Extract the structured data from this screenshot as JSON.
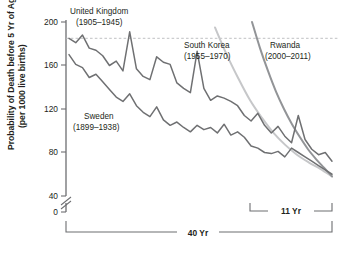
{
  "chart_data": {
    "type": "line",
    "title": "",
    "subtitle": "",
    "xlabel": "",
    "ylabel": "Probability of Death before 5 Yr of Age",
    "ylabel_line2": "(per 1000 live births)",
    "ylim": [
      0,
      200
    ],
    "yticks": [
      0,
      40,
      80,
      120,
      160,
      200
    ],
    "ytick_labels": [
      "0",
      "40",
      "80",
      "120",
      "160",
      "200"
    ],
    "y_axis_break": true,
    "y_axis_break_between": [
      0,
      40
    ],
    "grid": false,
    "legend_position": "inline-annotations",
    "reference_lines": [
      {
        "name": "start-level-dashed",
        "orientation": "horizontal",
        "y": 185,
        "style": "dashed"
      }
    ],
    "annotations": [
      {
        "name": "span-40-yr",
        "label": "40 Yr",
        "x_start": 0,
        "x_end": 100,
        "units": "percent-of-axis"
      },
      {
        "name": "span-11-yr",
        "label": "11 Yr",
        "x_start": 69,
        "x_end": 100,
        "units": "percent-of-axis"
      }
    ],
    "series": [
      {
        "name": "United Kingdom",
        "period": "(1905–1945)",
        "color": "#6f7072",
        "label_x": 70,
        "label_y": 10,
        "x": [
          0,
          1.2,
          2.4,
          3.6,
          4.8,
          6.0,
          7.2,
          8.4,
          9.6,
          10.8,
          12.0,
          13.2,
          14.4,
          15.6,
          16.8,
          18.0,
          19.2,
          20.4,
          21.6,
          22.8,
          24.0,
          25.2,
          26.4,
          27.6,
          28.8,
          30.0,
          31.2,
          32.4,
          33.6,
          34.8,
          36.0,
          37.2,
          38.4,
          39.6,
          40.8,
          42.0,
          43.2,
          44.4,
          45.6,
          46.8
        ],
        "y": [
          185,
          181,
          188,
          176,
          174,
          169,
          160,
          164,
          155,
          191,
          157,
          150,
          147,
          168,
          163,
          161,
          144,
          139,
          135,
          173,
          139,
          128,
          132,
          130,
          127,
          123,
          114,
          109,
          116,
          105,
          98,
          104,
          95,
          89,
          114,
          92,
          83,
          78,
          80,
          72
        ]
      },
      {
        "name": "Sweden",
        "period": "(1899–1938)",
        "color": "#6f7072",
        "label_x": 66,
        "label_y": 116,
        "x": [
          0,
          1.2,
          2.4,
          3.6,
          4.8,
          6.0,
          7.2,
          8.4,
          9.6,
          10.8,
          12.0,
          13.2,
          14.4,
          15.6,
          16.8,
          18.0,
          19.2,
          20.4,
          21.6,
          22.8,
          24.0,
          25.2,
          26.4,
          27.6,
          28.8,
          30.0,
          31.2,
          32.4,
          33.6,
          34.8,
          36.0,
          37.2,
          38.4,
          39.6,
          40.8,
          42.0,
          43.2,
          44.4,
          45.6,
          46.8
        ],
        "y": [
          170,
          161,
          158,
          149,
          152,
          145,
          138,
          131,
          127,
          134,
          123,
          117,
          113,
          122,
          110,
          105,
          108,
          103,
          99,
          105,
          101,
          103,
          98,
          106,
          96,
          99,
          94,
          86,
          84,
          80,
          79,
          81,
          76,
          84,
          80,
          76,
          72,
          68,
          64,
          60
        ]
      },
      {
        "name": "South Korea",
        "period": "(1955–1970)",
        "color": "#c6c7c9",
        "label_x": 187,
        "label_y": 45,
        "x": [
          0,
          10,
          20,
          30,
          40,
          50,
          60,
          70,
          80,
          90,
          100
        ],
        "y": [
          195,
          170,
          148,
          128,
          112,
          98,
          87,
          78,
          71,
          65,
          58
        ]
      },
      {
        "name": "Rwanda",
        "period": "(2000–2011)",
        "color": "#929497",
        "label_x": 270,
        "label_y": 45,
        "x": [
          0,
          10,
          20,
          30,
          40,
          50,
          60,
          70,
          80,
          90,
          100
        ],
        "y": [
          200,
          176,
          155,
          136,
          120,
          106,
          94,
          83,
          74,
          66,
          58
        ]
      }
    ]
  },
  "axis": {
    "y_title_line1": "Probability of Death before 5 Yr of Age",
    "y_title_line2": "(per 1000 live births)",
    "ticks": [
      {
        "label": "200"
      },
      {
        "label": "160"
      },
      {
        "label": "120"
      },
      {
        "label": "80"
      },
      {
        "label": "40"
      },
      {
        "label": "0"
      }
    ]
  },
  "labels": {
    "uk_name": "United Kingdom",
    "uk_period": "(1905–1945)",
    "sweden_name": "Sweden",
    "sweden_period": "(1899–1938)",
    "korea_name": "South Korea",
    "korea_period": "(1955–1970)",
    "rwanda_name": "Rwanda",
    "rwanda_period": "(2000–2011)",
    "span_11": "11 Yr",
    "span_40": "40 Yr"
  },
  "colors": {
    "dark_line": "#6f7072",
    "mid_line": "#929497",
    "light_line": "#c6c7c9",
    "axis": "#6d6e71",
    "dashed_ref": "#b9babc",
    "text": "#231f20"
  }
}
